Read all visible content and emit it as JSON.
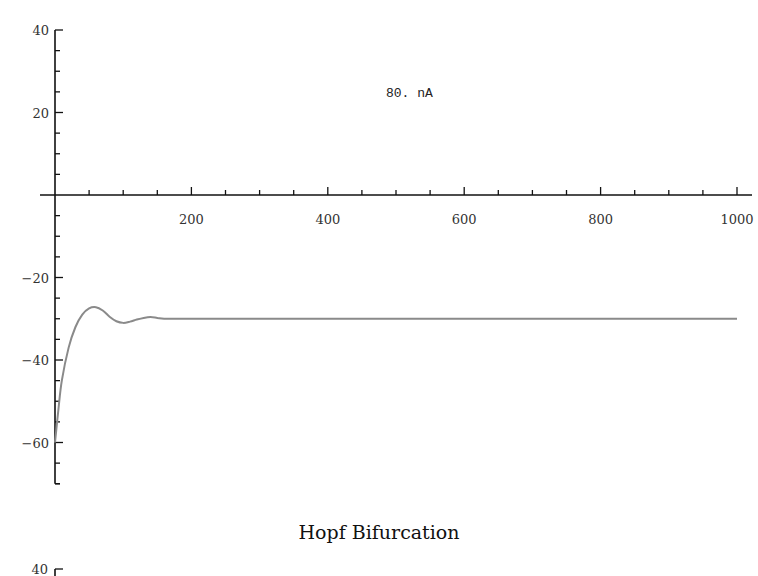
{
  "chart_data": [
    {
      "type": "line",
      "title": "",
      "annotation": "80. nA",
      "xlabel": "",
      "ylabel": "",
      "xlim": [
        0,
        1000
      ],
      "ylim": [
        -70,
        40
      ],
      "x_ticks": [
        200,
        400,
        600,
        800,
        1000
      ],
      "x_tick_labels": [
        "200",
        "400",
        "600",
        "800",
        "1000"
      ],
      "y_ticks": [
        40,
        20,
        -20,
        -40,
        -60
      ],
      "y_tick_labels": [
        "40",
        "20",
        "-20",
        "-40",
        "-60"
      ],
      "grid": false,
      "legend": null,
      "series": [
        {
          "name": "membrane potential",
          "x": [
            0,
            5,
            10,
            20,
            30,
            40,
            50,
            60,
            70,
            80,
            90,
            100,
            110,
            120,
            130,
            140,
            150,
            160,
            180,
            200,
            300,
            400,
            500,
            600,
            700,
            800,
            900,
            1000
          ],
          "y": [
            -60,
            -52,
            -45,
            -37,
            -32,
            -29,
            -27.5,
            -27.2,
            -28,
            -29.5,
            -30.6,
            -31,
            -30.7,
            -30.2,
            -29.8,
            -29.6,
            -29.8,
            -30,
            -30,
            -30,
            -30,
            -30,
            -30,
            -30,
            -30,
            -30,
            -30,
            -30
          ]
        }
      ]
    }
  ],
  "caption": "Hopf Bifurcation",
  "next_panel": {
    "y_tick_label": "40"
  }
}
